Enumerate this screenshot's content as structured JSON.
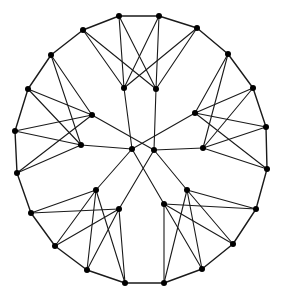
{
  "diagram": {
    "type": "graph",
    "width": 281,
    "height": 296,
    "background": "#ffffff",
    "edge_color": "#1a1a1a",
    "node_color": "#000000",
    "node_radius": 3,
    "nodes": [
      {
        "id": "T",
        "x": 83,
        "y": 30,
        "group": "outer"
      },
      {
        "id": "A",
        "x": 119,
        "y": 16,
        "group": "outer"
      },
      {
        "id": "B",
        "x": 159,
        "y": 16,
        "group": "outer"
      },
      {
        "id": "C",
        "x": 197,
        "y": 28,
        "group": "outer"
      },
      {
        "id": "D",
        "x": 228,
        "y": 54,
        "group": "outer"
      },
      {
        "id": "E",
        "x": 253,
        "y": 88,
        "group": "outer"
      },
      {
        "id": "F",
        "x": 266,
        "y": 127,
        "group": "outer"
      },
      {
        "id": "G",
        "x": 267,
        "y": 169,
        "group": "outer"
      },
      {
        "id": "H",
        "x": 256,
        "y": 209,
        "group": "outer"
      },
      {
        "id": "I",
        "x": 233,
        "y": 244,
        "group": "outer"
      },
      {
        "id": "J",
        "x": 202,
        "y": 269,
        "group": "outer"
      },
      {
        "id": "K",
        "x": 164,
        "y": 283,
        "group": "outer"
      },
      {
        "id": "L",
        "x": 125,
        "y": 283,
        "group": "outer"
      },
      {
        "id": "M",
        "x": 87,
        "y": 270,
        "group": "outer"
      },
      {
        "id": "N",
        "x": 55,
        "y": 246,
        "group": "outer"
      },
      {
        "id": "O",
        "x": 31,
        "y": 213,
        "group": "outer"
      },
      {
        "id": "P",
        "x": 17,
        "y": 173,
        "group": "outer"
      },
      {
        "id": "Q",
        "x": 15,
        "y": 131,
        "group": "outer"
      },
      {
        "id": "R",
        "x": 28,
        "y": 89,
        "group": "outer"
      },
      {
        "id": "S",
        "x": 51,
        "y": 55,
        "group": "outer"
      },
      {
        "id": "a",
        "x": 124,
        "y": 88,
        "group": "inner"
      },
      {
        "id": "b",
        "x": 156,
        "y": 89,
        "group": "inner"
      },
      {
        "id": "d",
        "x": 195,
        "y": 113,
        "group": "inner"
      },
      {
        "id": "h",
        "x": 203,
        "y": 148,
        "group": "inner"
      },
      {
        "id": "j",
        "x": 187,
        "y": 190,
        "group": "inner"
      },
      {
        "id": "g",
        "x": 164,
        "y": 204,
        "group": "inner"
      },
      {
        "id": "i",
        "x": 119,
        "y": 209,
        "group": "inner"
      },
      {
        "id": "f",
        "x": 96,
        "y": 190,
        "group": "inner"
      },
      {
        "id": "e",
        "x": 81,
        "y": 145,
        "group": "inner"
      },
      {
        "id": "c",
        "x": 92,
        "y": 115,
        "group": "inner"
      },
      {
        "id": "X",
        "x": 132,
        "y": 149,
        "group": "center"
      },
      {
        "id": "Y",
        "x": 154,
        "y": 150,
        "group": "center"
      }
    ],
    "edges": [
      [
        "T",
        "A",
        "ring"
      ],
      [
        "A",
        "B",
        "ring"
      ],
      [
        "B",
        "C",
        "ring"
      ],
      [
        "C",
        "D",
        "ring"
      ],
      [
        "D",
        "E",
        "ring"
      ],
      [
        "E",
        "F",
        "ring"
      ],
      [
        "F",
        "G",
        "ring"
      ],
      [
        "G",
        "H",
        "ring"
      ],
      [
        "H",
        "I",
        "ring"
      ],
      [
        "I",
        "J",
        "ring"
      ],
      [
        "J",
        "K",
        "ring"
      ],
      [
        "K",
        "L",
        "ring"
      ],
      [
        "L",
        "M",
        "ring"
      ],
      [
        "M",
        "N",
        "ring"
      ],
      [
        "N",
        "O",
        "ring"
      ],
      [
        "O",
        "P",
        "ring"
      ],
      [
        "P",
        "Q",
        "ring"
      ],
      [
        "Q",
        "R",
        "ring"
      ],
      [
        "R",
        "S",
        "ring"
      ],
      [
        "S",
        "T",
        "ring"
      ],
      [
        "a",
        "T"
      ],
      [
        "a",
        "A"
      ],
      [
        "a",
        "B"
      ],
      [
        "a",
        "C"
      ],
      [
        "b",
        "T"
      ],
      [
        "b",
        "A"
      ],
      [
        "b",
        "B"
      ],
      [
        "b",
        "C"
      ],
      [
        "d",
        "D"
      ],
      [
        "d",
        "E"
      ],
      [
        "d",
        "F"
      ],
      [
        "d",
        "G"
      ],
      [
        "h",
        "D"
      ],
      [
        "h",
        "E"
      ],
      [
        "h",
        "F"
      ],
      [
        "h",
        "G"
      ],
      [
        "j",
        "H"
      ],
      [
        "j",
        "I"
      ],
      [
        "j",
        "J"
      ],
      [
        "j",
        "K"
      ],
      [
        "g",
        "H"
      ],
      [
        "g",
        "I"
      ],
      [
        "g",
        "J"
      ],
      [
        "g",
        "K"
      ],
      [
        "f",
        "L"
      ],
      [
        "f",
        "M"
      ],
      [
        "f",
        "N"
      ],
      [
        "f",
        "O"
      ],
      [
        "i",
        "L"
      ],
      [
        "i",
        "M"
      ],
      [
        "i",
        "N"
      ],
      [
        "i",
        "O"
      ],
      [
        "c",
        "P"
      ],
      [
        "c",
        "Q"
      ],
      [
        "c",
        "R"
      ],
      [
        "c",
        "S"
      ],
      [
        "e",
        "P"
      ],
      [
        "e",
        "Q"
      ],
      [
        "e",
        "R"
      ],
      [
        "e",
        "S"
      ],
      [
        "X",
        "a"
      ],
      [
        "X",
        "e"
      ],
      [
        "X",
        "d"
      ],
      [
        "X",
        "f"
      ],
      [
        "X",
        "g"
      ],
      [
        "Y",
        "b"
      ],
      [
        "Y",
        "c"
      ],
      [
        "Y",
        "h"
      ],
      [
        "Y",
        "i"
      ],
      [
        "Y",
        "j"
      ]
    ]
  }
}
